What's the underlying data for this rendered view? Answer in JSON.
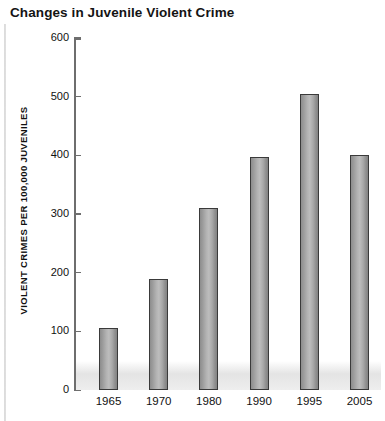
{
  "chart_data": {
    "type": "bar",
    "title": "Changes in Juvenile Violent Crime",
    "xlabel": "",
    "ylabel": "VIOLENT CRIMES PER 100,000 JUVENILES",
    "categories": [
      "1965",
      "1970",
      "1980",
      "1990",
      "1995",
      "2005"
    ],
    "values": [
      105,
      190,
      310,
      397,
      505,
      400
    ],
    "ylim": [
      0,
      600
    ],
    "yticks": [
      0,
      100,
      200,
      300,
      400,
      500,
      600
    ],
    "ytick_labels": [
      "0",
      "100",
      "200",
      "300",
      "400",
      "500",
      "600"
    ],
    "grid": false,
    "legend": null,
    "bar_color": "#a8a8a8",
    "bar_outline_color": "#3a3a3a",
    "axis_color": "#6e6e6e",
    "text_color": "#111111"
  }
}
